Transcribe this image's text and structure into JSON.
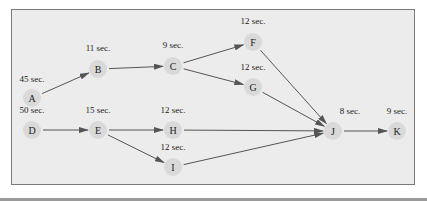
{
  "diagram": {
    "type": "precedence-diagram",
    "colors": {
      "background": "#ececec",
      "border": "#7a7a7a",
      "node_fill": "#d9d9d9",
      "edge": "#555555",
      "text": "#222222"
    },
    "nodes": [
      {
        "id": "A",
        "label": "A",
        "time": "45 sec.",
        "x": 32,
        "y": 98,
        "tx": 32,
        "ty": 82
      },
      {
        "id": "B",
        "label": "B",
        "time": "11 sec.",
        "x": 98,
        "y": 69,
        "tx": 98,
        "ty": 51
      },
      {
        "id": "C",
        "label": "C",
        "time": "9 sec.",
        "x": 173,
        "y": 66,
        "tx": 173,
        "ty": 48
      },
      {
        "id": "F",
        "label": "F",
        "time": "12 sec.",
        "x": 253,
        "y": 42,
        "tx": 253,
        "ty": 24
      },
      {
        "id": "G",
        "label": "G",
        "time": "12 sec.",
        "x": 253,
        "y": 87,
        "tx": 253,
        "ty": 70
      },
      {
        "id": "D",
        "label": "D",
        "time": "50 sec.",
        "x": 32,
        "y": 130,
        "tx": 32,
        "ty": 113
      },
      {
        "id": "E",
        "label": "E",
        "time": "15 sec.",
        "x": 98,
        "y": 130,
        "tx": 98,
        "ty": 113
      },
      {
        "id": "H",
        "label": "H",
        "time": "12 sec.",
        "x": 173,
        "y": 130,
        "tx": 173,
        "ty": 113
      },
      {
        "id": "I",
        "label": "I",
        "time": "12 sec.",
        "x": 173,
        "y": 167,
        "tx": 173,
        "ty": 150
      },
      {
        "id": "J",
        "label": "J",
        "time": "8 sec.",
        "x": 333,
        "y": 131,
        "tx": 350,
        "ty": 114
      },
      {
        "id": "K",
        "label": "K",
        "time": "9 sec.",
        "x": 397,
        "y": 131,
        "tx": 397,
        "ty": 114
      }
    ],
    "edges": [
      {
        "from": "A",
        "to": "B"
      },
      {
        "from": "B",
        "to": "C"
      },
      {
        "from": "C",
        "to": "F"
      },
      {
        "from": "C",
        "to": "G"
      },
      {
        "from": "F",
        "to": "J"
      },
      {
        "from": "G",
        "to": "J"
      },
      {
        "from": "D",
        "to": "E"
      },
      {
        "from": "E",
        "to": "H"
      },
      {
        "from": "E",
        "to": "I"
      },
      {
        "from": "H",
        "to": "J"
      },
      {
        "from": "I",
        "to": "J"
      },
      {
        "from": "J",
        "to": "K"
      }
    ]
  }
}
